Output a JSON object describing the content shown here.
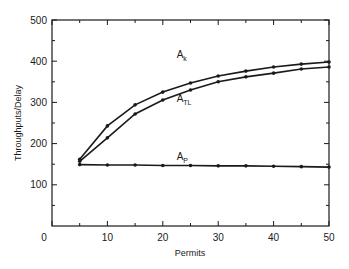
{
  "chart_data": {
    "type": "line",
    "title": "",
    "xlabel": "Permits",
    "ylabel": "Throughputs/Delay",
    "xlim": [
      0,
      50
    ],
    "ylim": [
      0,
      500
    ],
    "x_ticks_major": [
      0,
      10,
      20,
      30,
      40,
      50
    ],
    "x_ticks_minor": [
      5,
      15,
      25,
      35,
      45
    ],
    "y_ticks_major": [
      100,
      200,
      300,
      400,
      500
    ],
    "y_ticks_minor": [
      50,
      150,
      250,
      350,
      450
    ],
    "grid": false,
    "legend_position": "inline labels",
    "x": [
      5,
      10,
      15,
      20,
      25,
      30,
      35,
      40,
      45,
      50
    ],
    "series": [
      {
        "name": "A_k",
        "label_main": "A",
        "label_sub": "k",
        "label_pos": [
          22.5,
          408
        ],
        "values": [
          162,
          243,
          294,
          325,
          347,
          364,
          376,
          386,
          393,
          398
        ]
      },
      {
        "name": "A_TL",
        "label_main": "A",
        "label_sub": "TL",
        "label_pos": [
          22.5,
          300
        ],
        "values": [
          157,
          214,
          272,
          306,
          330,
          350,
          362,
          371,
          381,
          386
        ]
      },
      {
        "name": "A_P",
        "label_main": "A",
        "label_sub": "P",
        "label_pos": [
          22.5,
          160
        ],
        "values": [
          149,
          148,
          148,
          147,
          147,
          146,
          146,
          145,
          144,
          143
        ]
      }
    ]
  },
  "colors": {
    "line": "#1a1a1a",
    "axis": "#1a1a1a",
    "background": "#ffffff"
  }
}
